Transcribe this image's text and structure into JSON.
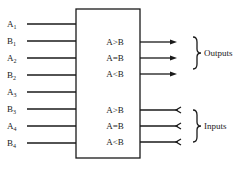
{
  "diagram": {
    "left_inputs": [
      {
        "letter": "A",
        "sub": "1"
      },
      {
        "letter": "B",
        "sub": "1"
      },
      {
        "letter": "A",
        "sub": "2"
      },
      {
        "letter": "B",
        "sub": "2"
      },
      {
        "letter": "A",
        "sub": "3"
      },
      {
        "letter": "B",
        "sub": "3"
      },
      {
        "letter": "A",
        "sub": "4"
      },
      {
        "letter": "B",
        "sub": "4"
      }
    ],
    "outputs": [
      "A>B",
      "A=B",
      "A<B"
    ],
    "cascade_inputs": [
      "A>B",
      "A=B",
      "A<B"
    ],
    "outputs_group_label": "Outputs",
    "inputs_group_label": "Inputs"
  }
}
